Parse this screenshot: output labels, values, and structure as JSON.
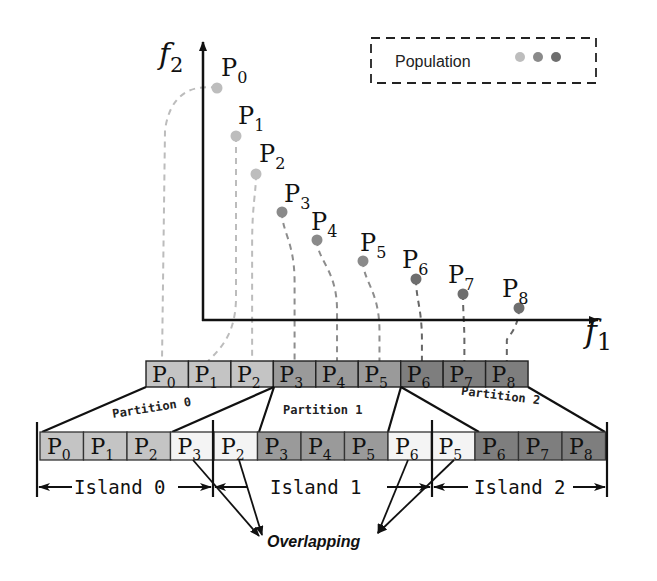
{
  "axes": {
    "y_label": "f",
    "y_sub": "2",
    "x_label": "f",
    "x_sub": "1"
  },
  "legend": {
    "label": "Population",
    "dot_colors": [
      "#bdbdbd",
      "#8a8a8a",
      "#6e6e6e"
    ]
  },
  "points": [
    {
      "name": "P",
      "sub": "0",
      "x": 217,
      "y": 88,
      "color": "#bdbdbd"
    },
    {
      "name": "P",
      "sub": "1",
      "x": 236,
      "y": 136,
      "color": "#bdbdbd"
    },
    {
      "name": "P",
      "sub": "2",
      "x": 256,
      "y": 174,
      "color": "#bdbdbd"
    },
    {
      "name": "P",
      "sub": "3",
      "x": 282,
      "y": 212,
      "color": "#8a8a8a"
    },
    {
      "name": "P",
      "sub": "4",
      "x": 317,
      "y": 240,
      "color": "#8a8a8a"
    },
    {
      "name": "P",
      "sub": "5",
      "x": 363,
      "y": 261,
      "color": "#8a8a8a"
    },
    {
      "name": "P",
      "sub": "6",
      "x": 416,
      "y": 279,
      "color": "#6e6e6e"
    },
    {
      "name": "P",
      "sub": "7",
      "x": 463,
      "y": 294,
      "color": "#6e6e6e"
    },
    {
      "name": "P",
      "sub": "8",
      "x": 519,
      "y": 308,
      "color": "#6e6e6e"
    }
  ],
  "top_array": [
    {
      "name": "P",
      "sub": "0",
      "fill": "#c4c4c4"
    },
    {
      "name": "P",
      "sub": "1",
      "fill": "#c4c4c4"
    },
    {
      "name": "P",
      "sub": "2",
      "fill": "#c4c4c4"
    },
    {
      "name": "P",
      "sub": "3",
      "fill": "#9a9a9a"
    },
    {
      "name": "P",
      "sub": "4",
      "fill": "#9a9a9a"
    },
    {
      "name": "P",
      "sub": "5",
      "fill": "#9a9a9a"
    },
    {
      "name": "P",
      "sub": "6",
      "fill": "#7e7e7e"
    },
    {
      "name": "P",
      "sub": "7",
      "fill": "#7e7e7e"
    },
    {
      "name": "P",
      "sub": "8",
      "fill": "#7e7e7e"
    }
  ],
  "partitions": [
    {
      "label": "Partition 0"
    },
    {
      "label": "Partition 1"
    },
    {
      "label": "Partition 2"
    }
  ],
  "bottom_row": [
    {
      "name": "P",
      "sub": "0",
      "fill": "#c4c4c4"
    },
    {
      "name": "P",
      "sub": "1",
      "fill": "#c4c4c4"
    },
    {
      "name": "P",
      "sub": "2",
      "fill": "#c4c4c4"
    },
    {
      "name": "P",
      "sub": "3",
      "fill": "#f4f4f4"
    },
    {
      "name": "P",
      "sub": "2",
      "fill": "#f4f4f4"
    },
    {
      "name": "P",
      "sub": "3",
      "fill": "#9a9a9a"
    },
    {
      "name": "P",
      "sub": "4",
      "fill": "#9a9a9a"
    },
    {
      "name": "P",
      "sub": "5",
      "fill": "#9a9a9a"
    },
    {
      "name": "P",
      "sub": "6",
      "fill": "#f4f4f4"
    },
    {
      "name": "P",
      "sub": "5",
      "fill": "#f4f4f4"
    },
    {
      "name": "P",
      "sub": "6",
      "fill": "#7e7e7e"
    },
    {
      "name": "P",
      "sub": "7",
      "fill": "#7e7e7e"
    },
    {
      "name": "P",
      "sub": "8",
      "fill": "#7e7e7e"
    }
  ],
  "islands": [
    {
      "label": "Island 0"
    },
    {
      "label": "Island 1"
    },
    {
      "label": "Island 2"
    }
  ],
  "overlap_label": "Overlapping"
}
